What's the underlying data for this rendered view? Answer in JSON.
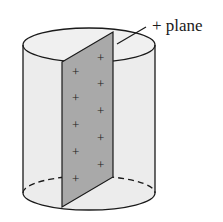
{
  "diagram": {
    "label": "+ plane",
    "charge_symbol": "+",
    "front_column_charges": 6,
    "back_column_charges": 6,
    "colors": {
      "cylinder_fill": "#ececec",
      "plane_fill": "#a9a9a9",
      "outline": "#1a1a1a"
    }
  }
}
